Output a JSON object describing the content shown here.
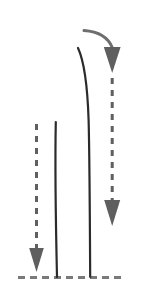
{
  "figure": {
    "width": 153,
    "height": 306,
    "background_color": "#ffffff",
    "colors": {
      "dark_stroke": "#2b2b2b",
      "gray_stroke": "#6e6e6e",
      "baseline_stroke": "#7a7a7a",
      "arrow_fill": "#5f5f5f"
    },
    "elements": {
      "baseline": {
        "name": "Horizontal dashed baseline",
        "y": 277,
        "x_start": 18,
        "x_end": 126,
        "dash_pattern": "7 5",
        "stroke_width": 3,
        "color": "#7a7a7a"
      },
      "short_solid_curve": {
        "name": "Short solid vertical curve (left)",
        "top_x": 56,
        "top_y": 122,
        "bottom_x": 57,
        "bottom_y": 277,
        "stroke_width": 2.2,
        "color": "#2b2b2b"
      },
      "tall_solid_curve": {
        "name": "Tall solid curved line (right)",
        "top_x": 78,
        "top_y": 48,
        "bottom_x": 90,
        "bottom_y": 277,
        "stroke_width": 2.2,
        "color": "#2b2b2b"
      },
      "left_dashed_arrow": {
        "name": "Left downward dashed arrow",
        "x": 36,
        "y_start": 124,
        "y_tip": 272,
        "dash_pattern": "6 6",
        "stroke_width": 3,
        "arrow_width": 15,
        "arrow_height": 24,
        "color": "#5f5f5f"
      },
      "right_dashed_arrow": {
        "name": "Right downward dashed arrow",
        "x": 112,
        "y_start": 76,
        "y_tip": 226,
        "dash_pattern": "6 6",
        "stroke_width": 3,
        "arrow_width": 16,
        "arrow_height": 26,
        "color": "#5f5f5f"
      },
      "curved_top_arrow": {
        "name": "Curved sweeping arrow at top right",
        "start_x": 84,
        "start_y": 30,
        "end_x": 112,
        "end_y": 48,
        "stroke_width": 3,
        "arrow_width": 17,
        "arrow_height": 26,
        "color": "#6e6e6e"
      }
    }
  }
}
